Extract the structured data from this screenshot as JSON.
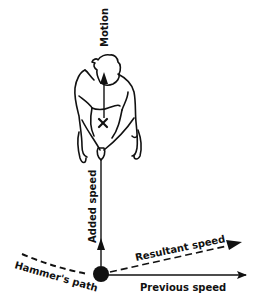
{
  "diagram": {
    "labels": {
      "motion": "Motion",
      "added_speed": "Added speed",
      "resultant_speed": "Resultant speed",
      "previous_speed": "Previous speed",
      "hammers_path": "Hammer's path"
    },
    "markers": {
      "center_of_mass": "×"
    },
    "colors": {
      "ink": "#111111",
      "background": "#ffffff"
    }
  }
}
